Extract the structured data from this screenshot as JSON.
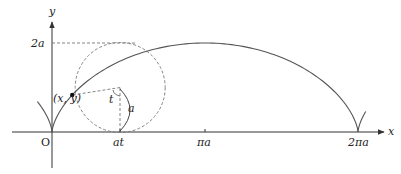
{
  "figure": {
    "colors": {
      "curve": "#555555",
      "axis": "#333333",
      "dashed": "#777777",
      "text": "#222222"
    },
    "origin_px": [
      52,
      132
    ],
    "scale_px": {
      "ax": 48.7,
      "ay": 44.5
    },
    "parameter_t": 1.4,
    "labels": {
      "x_axis": "x",
      "y_axis": "y",
      "origin": "O",
      "two_a": "2a",
      "point": "(x, y)",
      "angle": "t",
      "radius": "a",
      "at": "at",
      "pi_a": "πa",
      "two_pi_a": "2πa"
    },
    "elements": [
      "cycloid curve from -πa side through O to 2πa cusp",
      "rolling circle (dashed) of radius a centered at (at, a)",
      "dashed radius from circle center to point (x, y)",
      "dashed vertical radius from center to (at, 0)",
      "arc labeled a between center and (at,0)",
      "dashed horizontal line at height 2a"
    ]
  }
}
